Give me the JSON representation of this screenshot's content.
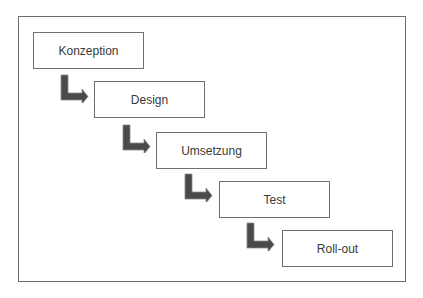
{
  "diagram": {
    "type": "waterfall-process",
    "steps": [
      {
        "label": "Konzeption"
      },
      {
        "label": "Design"
      },
      {
        "label": "Umsetzung"
      },
      {
        "label": "Test"
      },
      {
        "label": "Roll-out"
      }
    ],
    "colors": {
      "arrow_fill": "#4a4a4a",
      "arrow_stroke": "#8a8a8a",
      "box_border": "#707070",
      "text": "#3a3a3a"
    }
  }
}
